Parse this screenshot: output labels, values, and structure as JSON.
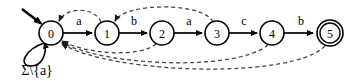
{
  "figure": {
    "kind": "finite-state-automaton-diagram",
    "states": [
      {
        "id": "0",
        "label": "0",
        "cx": 51,
        "cy": 33,
        "r": 12,
        "accepting": false,
        "initial": true
      },
      {
        "id": "1",
        "label": "1",
        "cx": 107,
        "cy": 33,
        "r": 12,
        "accepting": false,
        "initial": false
      },
      {
        "id": "2",
        "label": "2",
        "cx": 162,
        "cy": 33,
        "r": 12,
        "accepting": false,
        "initial": false
      },
      {
        "id": "3",
        "label": "3",
        "cx": 217,
        "cy": 33,
        "r": 12,
        "accepting": false,
        "initial": false
      },
      {
        "id": "4",
        "label": "4",
        "cx": 272,
        "cy": 33,
        "r": 12,
        "accepting": false,
        "initial": false
      },
      {
        "id": "5",
        "label": "5",
        "cx": 330,
        "cy": 33,
        "r": 12,
        "accepting": true,
        "initial": false
      }
    ],
    "forward_transitions": [
      {
        "from": "0",
        "to": "1",
        "label": "a",
        "label_x": 79,
        "label_y": 21
      },
      {
        "from": "1",
        "to": "2",
        "label": "b",
        "label_x": 134,
        "label_y": 21
      },
      {
        "from": "2",
        "to": "3",
        "label": "a",
        "label_x": 189,
        "label_y": 21
      },
      {
        "from": "3",
        "to": "4",
        "label": "c",
        "label_x": 244,
        "label_y": 21
      },
      {
        "from": "4",
        "to": "5",
        "label": "b",
        "label_x": 301,
        "label_y": 21
      }
    ],
    "failure_transitions": [
      {
        "from": "1",
        "to": "0",
        "style": "dashed",
        "route": "above"
      },
      {
        "from": "3",
        "to": "1",
        "style": "dashed",
        "route": "above"
      },
      {
        "from": "2",
        "to": "0",
        "style": "dashed",
        "route": "below"
      },
      {
        "from": "4",
        "to": "0",
        "style": "dashed",
        "route": "below"
      },
      {
        "from": "5",
        "to": "0",
        "style": "dashed",
        "route": "below"
      }
    ],
    "self_loop": {
      "state": "0",
      "label": "Σ\\{a}",
      "label_x": 37,
      "label_y": 70
    },
    "start_marker": {
      "target_state": "0",
      "from_x": 22,
      "from_y": 9,
      "to_x": 43,
      "to_y": 25
    },
    "colors": {
      "stroke": "#000000",
      "dashed_stroke": "#444444",
      "background": "#ffffff"
    }
  }
}
